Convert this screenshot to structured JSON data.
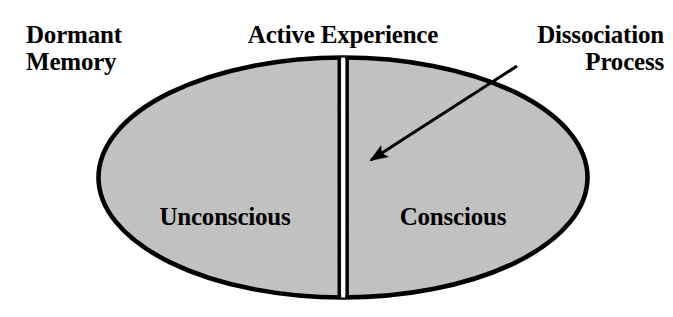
{
  "diagram": {
    "title": "Active Experience",
    "labels": {
      "dormant_memory": "Dormant\nMemory",
      "active_experience": "Active Experience",
      "dissociation_process": "Dissociation\nProcess",
      "unconscious": "Unconscious",
      "conscious": "Conscious"
    },
    "shape": {
      "type": "ellipse",
      "center_x": 343,
      "center_y": 177.5,
      "radius_x": 245,
      "radius_y": 120.5,
      "fill_color": "#c2c2c2",
      "stroke_color": "#000000",
      "stroke_width": 4.5
    },
    "divider": {
      "type": "double-vertical-line",
      "x": 343,
      "top_y": 57,
      "bottom_y": 298,
      "line_color": "#000000",
      "gap_color": "#ffffff",
      "line_width": 3.5,
      "gap_width": 4
    },
    "arrow": {
      "from_x": 517,
      "from_y": 66,
      "to_x": 363,
      "to_y": 166,
      "color": "#000000",
      "stroke_width": 3.2
    }
  }
}
